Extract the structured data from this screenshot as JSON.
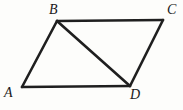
{
  "figure": {
    "background_color": "#fdfdfb",
    "stroke_color": "#1f1f1f",
    "label_color": "#1a1a1a",
    "stroke_width": 2.6,
    "width": 183,
    "height": 110,
    "vertices": [
      {
        "id": "A",
        "label": "A",
        "x": 22,
        "y": 87
      },
      {
        "id": "B",
        "label": "B",
        "x": 57,
        "y": 21
      },
      {
        "id": "C",
        "label": "C",
        "x": 163,
        "y": 20
      },
      {
        "id": "D",
        "label": "D",
        "x": 130,
        "y": 86
      }
    ],
    "edges": [
      {
        "id": "AB",
        "from": "A",
        "to": "B",
        "kind": "side"
      },
      {
        "id": "BC",
        "from": "B",
        "to": "C",
        "kind": "side"
      },
      {
        "id": "CD",
        "from": "C",
        "to": "D",
        "kind": "side"
      },
      {
        "id": "DA",
        "from": "D",
        "to": "A",
        "kind": "side"
      },
      {
        "id": "BD",
        "from": "B",
        "to": "D",
        "kind": "diagonal"
      }
    ]
  }
}
